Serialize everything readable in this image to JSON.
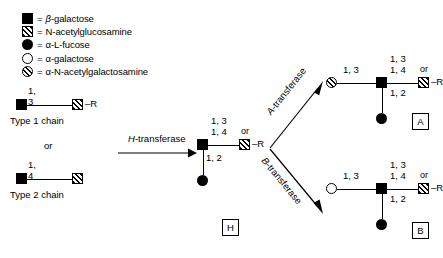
{
  "figure": {
    "colors": {
      "ink": "#000000",
      "background": "#ffffff"
    }
  },
  "legend": {
    "equals": "=",
    "items": [
      {
        "icon": "filled-square-icon",
        "symbol": "filled-square",
        "label_prefix": "β-",
        "label": "β-galactose"
      },
      {
        "icon": "hatched-square-icon",
        "symbol": "hatched-square",
        "label_prefix": "",
        "label": "N-acetylglucosamine"
      },
      {
        "icon": "filled-circle-icon",
        "symbol": "filled-circle",
        "label_prefix": "α-",
        "label": "α-L-fucose"
      },
      {
        "icon": "open-circle-icon",
        "symbol": "open-circle",
        "label_prefix": "α-",
        "label": "α-galactose"
      },
      {
        "icon": "hatched-circle-icon",
        "symbol": "hatched-circle",
        "label_prefix": "α-",
        "label": "α-N-acetylgalactosamine"
      }
    ]
  },
  "substrates": {
    "type1": {
      "name": "Type 1 chain",
      "linkage": "1, 3",
      "terminal": "–R"
    },
    "or_text": "or",
    "type2": {
      "name": "Type 2 chain",
      "linkage": "1, 4",
      "terminal": ""
    }
  },
  "enzymes": {
    "h": {
      "letter": "H",
      "suffix": "-transferase",
      "full": "H-transferase"
    },
    "a": {
      "letter": "A",
      "suffix": "-transferase",
      "full": "A-transferase"
    },
    "b": {
      "letter": "B",
      "suffix": "-transferase",
      "full": "B-transferase"
    }
  },
  "products": {
    "h": {
      "badge": "H",
      "linkage_top1": "1, 3",
      "linkage_top2": "1, 4",
      "or_text": "or",
      "linkage_fucose": "1, 2",
      "terminal": "–R"
    },
    "a": {
      "badge": "A",
      "linkage_head": "1, 3",
      "linkage_top1": "1, 3",
      "linkage_top2": "1, 4",
      "or_text": "or",
      "linkage_fucose": "1, 2",
      "terminal": "–R"
    },
    "b": {
      "badge": "B",
      "linkage_head": "1, 3",
      "linkage_top1": "1, 3",
      "linkage_top2": "1, 4",
      "or_text": "or",
      "linkage_fucose": "1, 2",
      "terminal": "–R"
    }
  }
}
